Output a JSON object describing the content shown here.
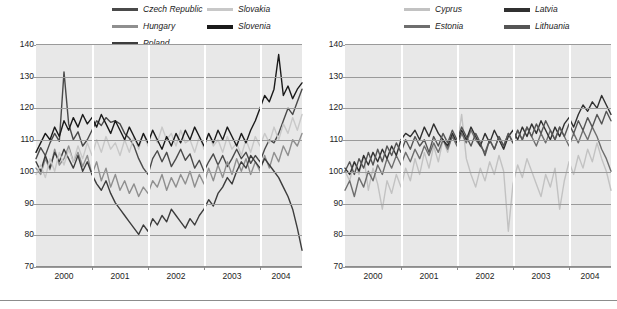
{
  "chart_data": [
    {
      "type": "line",
      "title": "",
      "id": "new-member-states-central",
      "xlabel": "",
      "ylabel": "",
      "ylim": [
        70,
        140
      ],
      "yticks": [
        70,
        80,
        90,
        100,
        110,
        120,
        130,
        140
      ],
      "xlim": [
        2000,
        2004.75
      ],
      "xticks": [
        2000,
        2001,
        2002,
        2003,
        2004
      ],
      "xtick_labels": [
        "2000",
        "2001",
        "2002",
        "2003",
        "2004"
      ],
      "grid": true,
      "legend_position": "top",
      "series": [
        {
          "name": "Czech Republic",
          "color": "#4a4a4a",
          "values": [
            104,
            107.5,
            105,
            109,
            112,
            109.5,
            131.5,
            115,
            110,
            112.5,
            108,
            110,
            113,
            116,
            114.5,
            117,
            115.5,
            116,
            115,
            112,
            110.5,
            108,
            104,
            101,
            99,
            104,
            106.5,
            103,
            106,
            101.5,
            104,
            107,
            103.5,
            105.5,
            101,
            103.5,
            100,
            103,
            105.5,
            102,
            105,
            101.5,
            104,
            107,
            104,
            106,
            102.5,
            105,
            103,
            107,
            110,
            109,
            112,
            116,
            120,
            118,
            122,
            126
          ]
        },
        {
          "name": "Hungary",
          "color": "#8f8f8f",
          "values": [
            101,
            99,
            104,
            100.5,
            107,
            102,
            104,
            108,
            103,
            106,
            101.5,
            105,
            99,
            103,
            97,
            101,
            95,
            99,
            94,
            97,
            93,
            96,
            92,
            95,
            93,
            97,
            95,
            99,
            94,
            98,
            95,
            99,
            96,
            100,
            95,
            99,
            96,
            101,
            97,
            102,
            98,
            103,
            99,
            104,
            100,
            104,
            99,
            103,
            100,
            105,
            101,
            106,
            103,
            108,
            105,
            110,
            108,
            112
          ]
        },
        {
          "name": "Poland",
          "color": "#3c3c3c",
          "values": [
            103,
            100,
            105,
            101,
            106,
            103,
            107,
            104,
            101,
            105,
            100,
            103,
            99,
            96,
            94,
            97,
            93,
            90,
            88,
            86,
            84,
            82,
            80,
            83,
            81,
            85,
            83,
            86,
            84,
            88,
            86,
            84,
            82,
            85,
            83,
            86,
            88,
            91,
            89,
            93,
            95,
            98,
            96,
            100,
            103,
            101,
            105,
            103,
            101,
            104,
            102,
            100,
            98,
            95,
            92,
            88,
            82,
            75
          ]
        },
        {
          "name": "Slovakia",
          "color": "#c8c8c8",
          "values": [
            99,
            102,
            98,
            104,
            100,
            106,
            102,
            107,
            103,
            108,
            104,
            109,
            105,
            110,
            106,
            111,
            107,
            109,
            105,
            110,
            106,
            111,
            107,
            112,
            108,
            113,
            109,
            114,
            110,
            112,
            108,
            113,
            109,
            110,
            106,
            111,
            107,
            112,
            108,
            110,
            106,
            111,
            107,
            109,
            105,
            110,
            106,
            111,
            108,
            112,
            109,
            114,
            110,
            115,
            112,
            117,
            113,
            118
          ]
        },
        {
          "name": "Slovenia",
          "color": "#1a1a1a",
          "values": [
            106,
            109,
            112,
            110,
            114,
            111,
            116,
            113,
            117,
            114,
            118,
            115,
            117,
            114,
            118,
            115,
            112,
            116,
            113,
            110,
            114,
            111,
            108,
            112,
            109,
            113,
            110,
            107,
            111,
            108,
            112,
            109,
            113,
            110,
            114,
            111,
            108,
            112,
            109,
            113,
            110,
            114,
            111,
            108,
            112,
            109,
            113,
            116,
            120,
            124,
            122,
            126,
            137,
            124,
            127,
            123,
            126,
            128
          ]
        }
      ]
    },
    {
      "type": "line",
      "title": "",
      "id": "new-member-states-baltic-cyprus",
      "xlabel": "",
      "ylabel": "",
      "ylim": [
        70,
        140
      ],
      "yticks": [
        70,
        80,
        90,
        100,
        110,
        120,
        130,
        140
      ],
      "xlim": [
        2000,
        2004.75
      ],
      "xticks": [
        2000,
        2001,
        2002,
        2003,
        2004
      ],
      "xtick_labels": [
        "2000",
        "2001",
        "2002",
        "2003",
        "2004"
      ],
      "grid": true,
      "legend_position": "top",
      "series": [
        {
          "name": "Cyprus",
          "color": "#c2c2c2",
          "values": [
            100,
            97,
            103,
            99,
            105,
            94,
            101,
            96,
            88,
            97,
            93,
            99,
            95,
            101,
            97,
            104,
            99,
            106,
            101,
            108,
            103,
            110,
            106,
            112,
            108,
            118,
            104,
            99,
            95,
            101,
            97,
            103,
            99,
            105,
            100,
            81,
            96,
            102,
            98,
            104,
            100,
            96,
            92,
            99,
            95,
            101,
            88,
            97,
            103,
            99,
            105,
            101,
            107,
            103,
            109,
            104,
            100,
            94
          ]
        },
        {
          "name": "Estonia",
          "color": "#6e6e6e",
          "values": [
            94,
            97,
            92,
            98,
            95,
            100,
            97,
            102,
            99,
            104,
            101,
            105,
            102,
            106,
            103,
            107,
            104,
            108,
            105,
            109,
            106,
            110,
            107,
            111,
            108,
            112,
            109,
            113,
            110,
            108,
            106,
            110,
            107,
            111,
            108,
            112,
            109,
            113,
            110,
            114,
            111,
            108,
            112,
            109,
            113,
            110,
            114,
            111,
            108,
            112,
            109,
            113,
            110,
            114,
            111,
            107,
            104,
            100
          ]
        },
        {
          "name": "Latvia",
          "color": "#303030",
          "values": [
            101,
            99,
            103,
            100,
            105,
            102,
            106,
            103,
            107,
            104,
            108,
            105,
            110,
            112,
            111,
            113,
            110,
            114,
            111,
            115,
            112,
            110,
            108,
            112,
            109,
            113,
            110,
            114,
            111,
            108,
            112,
            109,
            113,
            110,
            107,
            111,
            113,
            110,
            114,
            111,
            115,
            112,
            116,
            113,
            110,
            114,
            111,
            115,
            117,
            114,
            118,
            121,
            119,
            122,
            120,
            124,
            121,
            118
          ]
        },
        {
          "name": "Lithuania",
          "color": "#555555",
          "values": [
            100,
            103,
            99,
            104,
            101,
            106,
            102,
            107,
            103,
            108,
            105,
            109,
            106,
            110,
            107,
            111,
            108,
            110,
            106,
            111,
            108,
            112,
            109,
            113,
            110,
            114,
            111,
            108,
            112,
            109,
            105,
            110,
            107,
            111,
            108,
            112,
            109,
            113,
            110,
            114,
            111,
            115,
            112,
            116,
            113,
            110,
            114,
            111,
            115,
            112,
            116,
            113,
            117,
            114,
            118,
            115,
            119,
            116
          ]
        }
      ]
    }
  ],
  "legends": {
    "left": {
      "column1": [
        "Czech Republic",
        "Hungary",
        "Poland"
      ],
      "column2": [
        "Slovakia",
        "Slovenia"
      ]
    },
    "right": {
      "column1": [
        "Cyprus",
        "Estonia"
      ],
      "column2": [
        "Latvia",
        "Lithuania"
      ]
    }
  },
  "axes": {
    "ytick_labels": [
      "140",
      "130",
      "120",
      "110",
      "100",
      "90",
      "80",
      "70"
    ],
    "xtick_labels": [
      "2000",
      "2001",
      "2002",
      "2003",
      "2004"
    ]
  },
  "colors": {
    "plot_background": "#e8e8e8",
    "gridline": "#9a9a9a",
    "vertical_gridline": "#ffffff",
    "axis": "#8c8c8c",
    "text": "#1d1d1d"
  }
}
